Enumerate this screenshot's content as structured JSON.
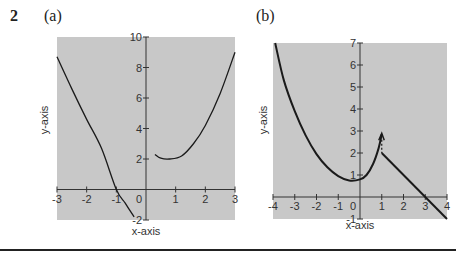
{
  "question_number": "2",
  "chart_data": [
    {
      "type": "line",
      "panel_label": "(a)",
      "xlabel": "x-axis",
      "ylabel": "y-axis",
      "xlim": [
        -3,
        3
      ],
      "ylim": [
        -2,
        10
      ],
      "xticks": [
        "-3",
        "-2",
        "-1",
        "0",
        "1",
        "2",
        "3"
      ],
      "yticks": [
        "-2",
        "2",
        "4",
        "6",
        "8",
        "10"
      ],
      "grid": false,
      "background": "#c8c8c8",
      "series": [
        {
          "name": "left branch",
          "points": [
            [
              -3,
              8.7
            ],
            [
              -2.5,
              6.6
            ],
            [
              -2,
              4.6
            ],
            [
              -1.5,
              2.7
            ],
            [
              -1,
              0.0
            ],
            [
              -0.7,
              -0.9
            ],
            [
              -0.4,
              -1.8
            ]
          ]
        },
        {
          "name": "right branch",
          "points": [
            [
              0.3,
              2.3
            ],
            [
              0.5,
              2.05
            ],
            [
              0.8,
              2.0
            ],
            [
              1.2,
              2.2
            ],
            [
              1.6,
              3.0
            ],
            [
              2.0,
              4.2
            ],
            [
              2.5,
              6.3
            ],
            [
              3.0,
              9.0
            ]
          ]
        }
      ]
    },
    {
      "type": "line",
      "panel_label": "(b)",
      "xlabel": "x-axis",
      "ylabel": "y-axis",
      "xlim": [
        -4,
        4
      ],
      "ylim": [
        -1,
        7
      ],
      "xticks": [
        "-4",
        "-3",
        "-2",
        "-1",
        "0",
        "1",
        "2",
        "3",
        "4"
      ],
      "yticks": [
        "-1",
        "1",
        "2",
        "3",
        "4",
        "5",
        "6",
        "7"
      ],
      "grid": false,
      "background": "#c8c8c8",
      "series": [
        {
          "name": "curve",
          "points": [
            [
              -3.9,
              7.0
            ],
            [
              -3.5,
              5.3
            ],
            [
              -3,
              3.9
            ],
            [
              -2.5,
              2.8
            ],
            [
              -2,
              1.95
            ],
            [
              -1.5,
              1.35
            ],
            [
              -1,
              0.95
            ],
            [
              -0.5,
              0.75
            ],
            [
              0,
              0.8
            ],
            [
              0.3,
              1.0
            ],
            [
              0.6,
              1.5
            ],
            [
              0.85,
              2.2
            ],
            [
              1.0,
              2.85
            ]
          ]
        },
        {
          "name": "dashed jump",
          "style": "dashed",
          "points": [
            [
              1,
              2.6
            ],
            [
              1,
              2.0
            ]
          ]
        },
        {
          "name": "line",
          "points": [
            [
              1,
              2.0
            ],
            [
              4,
              -1.0
            ]
          ]
        }
      ]
    }
  ]
}
